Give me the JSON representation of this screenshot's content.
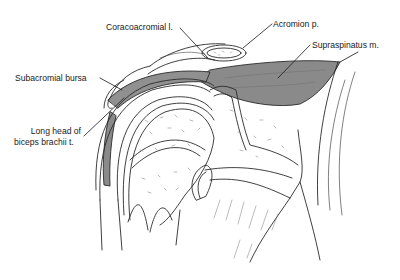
{
  "figure": {
    "colors": {
      "line": "#2a2a2a",
      "muscle_fill": "#8a8a8a",
      "tendon_fill": "#909090",
      "background": "#ffffff"
    },
    "labels": [
      {
        "id": "coracoacromial",
        "text": "Coracoacromial l."
      },
      {
        "id": "acromion",
        "text": "Acromion p."
      },
      {
        "id": "supraspinatus",
        "text": "Supraspinatus m."
      },
      {
        "id": "subacromial_bursa",
        "text": "Subacromial bursa"
      },
      {
        "id": "biceps_line1",
        "text": "Long head of"
      },
      {
        "id": "biceps_line2",
        "text": "biceps brachii t."
      }
    ]
  }
}
